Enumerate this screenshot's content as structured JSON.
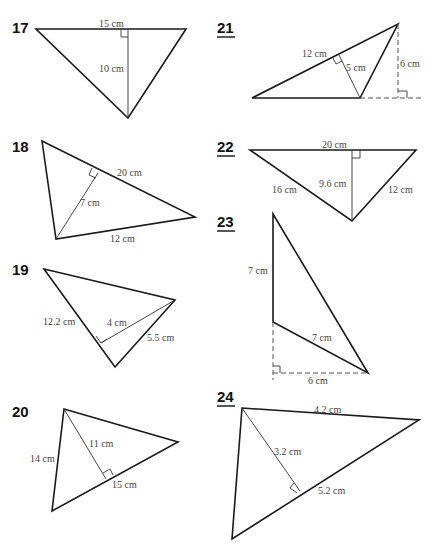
{
  "problems": [
    {
      "number": "17",
      "underlined": false,
      "labels": [
        "15 cm",
        "10 cm"
      ]
    },
    {
      "number": "18",
      "underlined": false,
      "labels": [
        "20 cm",
        "7 cm",
        "12 cm"
      ]
    },
    {
      "number": "19",
      "underlined": false,
      "labels": [
        "12.2 cm",
        "4 cm",
        "5.5 cm"
      ]
    },
    {
      "number": "20",
      "underlined": false,
      "labels": [
        "14 cm",
        "11 cm",
        "15 cm"
      ]
    },
    {
      "number": "21",
      "underlined": true,
      "labels": [
        "12 cm",
        "5 cm",
        "6 cm"
      ]
    },
    {
      "number": "22",
      "underlined": true,
      "labels": [
        "20 cm",
        "16 cm",
        "9.6 cm",
        "12 cm"
      ]
    },
    {
      "number": "23",
      "underlined": true,
      "labels": [
        "7 cm",
        "7 cm",
        "6 cm"
      ]
    },
    {
      "number": "24",
      "underlined": true,
      "labels": [
        "4.2 cm",
        "3.2 cm",
        "5.2 cm"
      ]
    }
  ]
}
